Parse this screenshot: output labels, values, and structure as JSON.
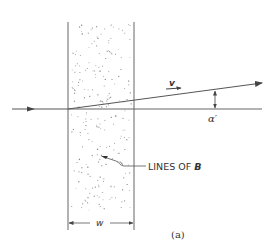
{
  "diagram": {
    "velocity_label": "v",
    "angle_label": "α′",
    "field_label_prefix": "LINES OF ",
    "field_label_symbol": "B",
    "width_label": "w",
    "caption": "(a)",
    "colors": {
      "line": "#555555",
      "dots": "#777777",
      "background": "#ffffff"
    }
  }
}
